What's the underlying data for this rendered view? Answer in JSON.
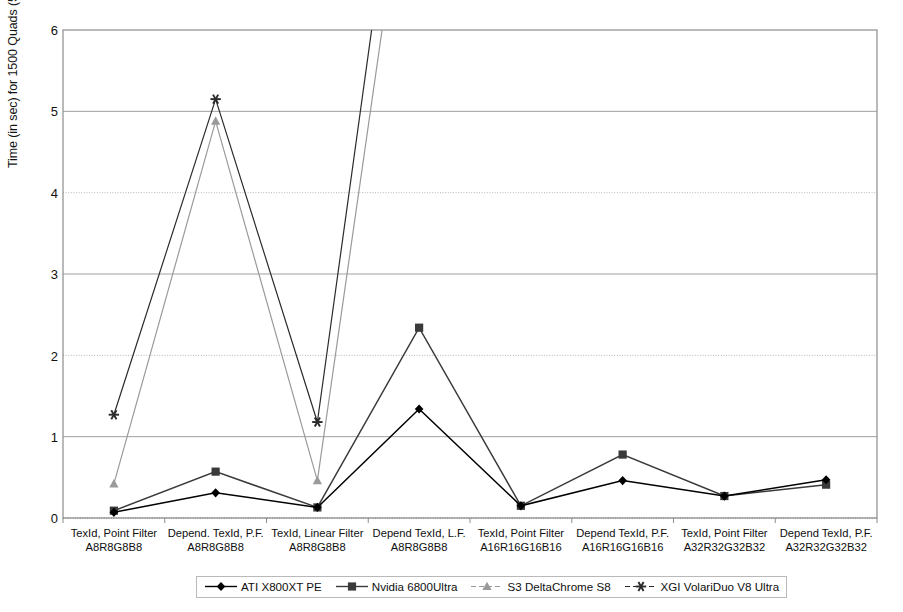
{
  "chart_data": {
    "type": "line",
    "title": "",
    "xlabel": "",
    "ylabel": "Time (in sec) for 1500 Quads (512x512)",
    "ylim": [
      0,
      6
    ],
    "yticks": [
      0,
      1,
      2,
      3,
      4,
      5,
      6
    ],
    "ytick_labels": [
      "0",
      "1",
      "2",
      "3",
      "4",
      "5",
      "6"
    ],
    "grid": true,
    "legend_position": "bottom",
    "categories": [
      "TexId, Point Filter\nA8R8G8B8",
      "Depend. TexId, P.F.\nA8R8G8B8",
      "TexId, Linear Filter\nA8R8G8B8",
      "Depend TexId, L.F.\nA8R8G8B8",
      "TexId, Point Filter\nA16R16G16B16",
      "Depend TexId, P.F.\nA16R16G16B16",
      "TexId, Point Filter\nA32R32G32B32",
      "Depend TexId, P.F.\nA32R32G32B32"
    ],
    "category_lines": [
      [
        "TexId, Point Filter",
        "A8R8G8B8"
      ],
      [
        "Depend. TexId, P.F.",
        "A8R8G8B8"
      ],
      [
        "TexId, Linear Filter",
        "A8R8G8B8"
      ],
      [
        "Depend TexId, L.F.",
        "A8R8G8B8"
      ],
      [
        "TexId, Point Filter",
        "A16R16G16B16"
      ],
      [
        "Depend TexId, P.F.",
        "A16R16G16B16"
      ],
      [
        "TexId, Point Filter",
        "A32R32G32B32"
      ],
      [
        "Depend TexId, P.F.",
        "A32R32G32B32"
      ]
    ],
    "series": [
      {
        "name": "ATI X800XT PE",
        "marker": "diamond",
        "color": "#000000",
        "values": [
          0.07,
          0.31,
          0.13,
          1.34,
          0.15,
          0.46,
          0.27,
          0.47
        ]
      },
      {
        "name": "Nvidia 6800Ultra",
        "marker": "square",
        "color": "#3a3a3a",
        "values": [
          0.09,
          0.57,
          0.13,
          2.34,
          0.15,
          0.78,
          0.27,
          0.41
        ]
      },
      {
        "name": "S3 DeltaChrome S8",
        "marker": "triangle",
        "color": "#9a9a9a",
        "values": [
          0.42,
          4.88,
          0.46,
          null,
          null,
          null,
          null,
          null
        ]
      },
      {
        "name": "XGI VolariDuo V8 Ultra",
        "marker": "star",
        "color": "#2b2b2b",
        "values": [
          1.27,
          5.15,
          1.18,
          null,
          null,
          null,
          null,
          null
        ]
      }
    ],
    "offscale_note": "S3 and XGI series rise above the 6.0 axis maximum between category 3 and 4 and are clipped at the top of the plot."
  }
}
